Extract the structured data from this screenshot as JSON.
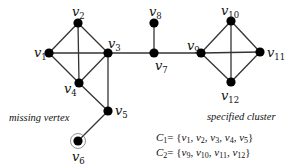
{
  "diagram": {
    "type": "graph",
    "nodes": [
      {
        "id": "v1",
        "base": "v",
        "sub": "1",
        "x": 49,
        "y": 53,
        "label_dx": -15,
        "label_dy": 4
      },
      {
        "id": "v2",
        "base": "v",
        "sub": "2",
        "x": 78,
        "y": 23,
        "label_dx": -6,
        "label_dy": -7
      },
      {
        "id": "v3",
        "base": "v",
        "sub": "3",
        "x": 108,
        "y": 53,
        "label_dx": 0,
        "label_dy": -5
      },
      {
        "id": "v4",
        "base": "v",
        "sub": "4",
        "x": 79,
        "y": 83,
        "label_dx": -15,
        "label_dy": 10
      },
      {
        "id": "v5",
        "base": "v",
        "sub": "5",
        "x": 108,
        "y": 111,
        "label_dx": 7,
        "label_dy": 4
      },
      {
        "id": "v6",
        "base": "v",
        "sub": "6",
        "x": 78,
        "y": 141,
        "label_dx": -6,
        "label_dy": 20,
        "ring": true
      },
      {
        "id": "v7",
        "base": "v",
        "sub": "7",
        "x": 154,
        "y": 53,
        "label_dx": 1,
        "label_dy": 17
      },
      {
        "id": "v8",
        "base": "v",
        "sub": "8",
        "x": 154,
        "y": 23,
        "label_dx": -5,
        "label_dy": -7
      },
      {
        "id": "v9",
        "base": "v",
        "sub": "9",
        "x": 201,
        "y": 53,
        "label_dx": -14,
        "label_dy": -3
      },
      {
        "id": "v10",
        "base": "v",
        "sub": "10",
        "x": 231,
        "y": 21,
        "label_dx": -10,
        "label_dy": -6
      },
      {
        "id": "v11",
        "base": "v",
        "sub": "11",
        "x": 260,
        "y": 52,
        "label_dx": 7,
        "label_dy": 5
      },
      {
        "id": "v12",
        "base": "v",
        "sub": "12",
        "x": 231,
        "y": 82,
        "label_dx": -10,
        "label_dy": 18
      }
    ],
    "edges": [
      [
        "v1",
        "v2"
      ],
      [
        "v1",
        "v3"
      ],
      [
        "v1",
        "v4"
      ],
      [
        "v2",
        "v3"
      ],
      [
        "v2",
        "v4"
      ],
      [
        "v3",
        "v4"
      ],
      [
        "v3",
        "v5"
      ],
      [
        "v4",
        "v5"
      ],
      [
        "v5",
        "v6"
      ],
      [
        "v3",
        "v7"
      ],
      [
        "v7",
        "v8"
      ],
      [
        "v7",
        "v9"
      ],
      [
        "v9",
        "v10"
      ],
      [
        "v9",
        "v11"
      ],
      [
        "v9",
        "v12"
      ],
      [
        "v10",
        "v11"
      ],
      [
        "v10",
        "v12"
      ],
      [
        "v11",
        "v12"
      ]
    ],
    "annotations": {
      "missing_vertex": "missing vertex",
      "specified_cluster": "specified cluster"
    },
    "clusters": [
      {
        "name": "C",
        "sub": "1",
        "members": [
          "v1",
          "v2",
          "v3",
          "v4",
          "v5"
        ]
      },
      {
        "name": "C",
        "sub": "2",
        "members": [
          "v9",
          "v10",
          "v11",
          "v12"
        ]
      }
    ]
  }
}
